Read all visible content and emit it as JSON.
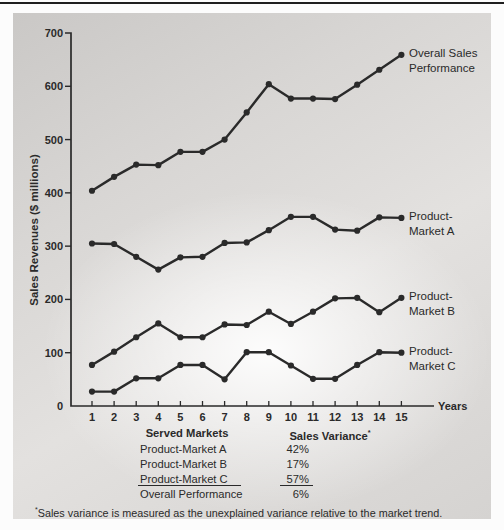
{
  "chart_data": {
    "type": "line",
    "title": "",
    "x": [
      1,
      2,
      3,
      4,
      5,
      6,
      7,
      8,
      9,
      10,
      11,
      12,
      13,
      14,
      15
    ],
    "xlabel": "Years",
    "ylabel": "Sales Revenues ($ millions)",
    "ylim": [
      0,
      700
    ],
    "y_ticks": [
      0,
      100,
      200,
      300,
      400,
      500,
      600,
      700
    ],
    "grid": false,
    "legend_position": "right-end-labels",
    "color": "#2a2a2a",
    "series": [
      {
        "id": "overall",
        "name": "Overall Sales Performance",
        "label_lines": [
          "Overall Sales",
          "Performance"
        ],
        "values": [
          404,
          430,
          453,
          452,
          477,
          477,
          500,
          551,
          604,
          577,
          577,
          576,
          603,
          631,
          659
        ]
      },
      {
        "id": "market-a",
        "name": "Product-Market A",
        "label_lines": [
          "Product-",
          "Market A"
        ],
        "values": [
          305,
          304,
          280,
          256,
          279,
          280,
          306,
          307,
          330,
          355,
          355,
          331,
          329,
          354,
          353
        ]
      },
      {
        "id": "market-b",
        "name": "Product-Market B",
        "label_lines": [
          "Product-",
          "Market B"
        ],
        "values": [
          77,
          102,
          129,
          155,
          129,
          129,
          153,
          152,
          177,
          154,
          177,
          202,
          203,
          176,
          203
        ]
      },
      {
        "id": "market-c",
        "name": "Product-Market C",
        "label_lines": [
          "Product-",
          "Market C"
        ],
        "values": [
          27,
          27,
          52,
          52,
          77,
          77,
          50,
          101,
          101,
          76,
          51,
          51,
          77,
          101,
          100
        ]
      }
    ]
  },
  "table": {
    "col1_header": "Served Markets",
    "col2_header": "Sales Variance",
    "col2_header_superscript": "*",
    "rows": [
      {
        "label": "Product-Market A",
        "value": "42%"
      },
      {
        "label": "Product-Market B",
        "value": "17%"
      },
      {
        "label": "Product-Market C",
        "value": "57%"
      },
      {
        "label": "Overall Performance",
        "value": "6%"
      }
    ]
  },
  "footnote": {
    "marker": "*",
    "text": "Sales variance is measured as the unexplained variance relative to the market trend."
  }
}
